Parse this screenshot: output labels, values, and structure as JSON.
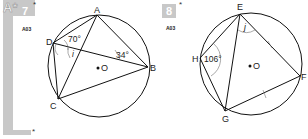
{
  "section": {
    "letter": "A*",
    "side_star": "*",
    "bottom_star": "*"
  },
  "questions": [
    {
      "number": "7",
      "star": "*",
      "ref": "A03",
      "points": [
        "A",
        "B",
        "C",
        "D",
        "O"
      ],
      "angles": {
        "D_top": "70°",
        "B": "34°",
        "unknown": "i"
      },
      "centre_label": "O"
    },
    {
      "number": "8",
      "star": "*",
      "ref": "A03",
      "points": [
        "E",
        "F",
        "G",
        "H",
        "O"
      ],
      "angles": {
        "H": "106°",
        "unknown": "j"
      },
      "centre_label": "O",
      "equal_marks": [
        "EF",
        "FG"
      ]
    }
  ]
}
